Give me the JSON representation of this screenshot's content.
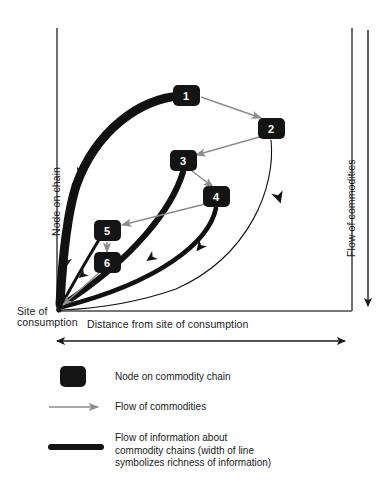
{
  "diagram": {
    "axes": {
      "y_label": "Node on chain",
      "x_label": "Distance from site of consumption",
      "right_label": "Flow of commodities",
      "origin_label_line1": "Site of",
      "origin_label_line2": "consumption"
    },
    "nodes": [
      {
        "id": "1",
        "label": "1",
        "x": 186,
        "y": 95
      },
      {
        "id": "2",
        "label": "2",
        "x": 271,
        "y": 128
      },
      {
        "id": "3",
        "label": "3",
        "x": 183,
        "y": 160
      },
      {
        "id": "4",
        "label": "4",
        "x": 216,
        "y": 196
      },
      {
        "id": "5",
        "label": "5",
        "x": 107,
        "y": 230
      },
      {
        "id": "6",
        "label": "6",
        "x": 107,
        "y": 262
      }
    ],
    "commodity_arrows": [
      {
        "from": "1",
        "to": "2"
      },
      {
        "from": "2",
        "to": "3"
      },
      {
        "from": "3",
        "to": "4"
      },
      {
        "from": "4",
        "to": "5"
      },
      {
        "from": "5",
        "to": "6"
      },
      {
        "from": "6",
        "to": "site-of-consumption"
      }
    ],
    "information_flows": [
      {
        "from": "1",
        "to": "site-of-consumption",
        "width": 9,
        "richness": "highest"
      },
      {
        "from": "3",
        "to": "site-of-consumption",
        "width": 6,
        "richness": "high"
      },
      {
        "from": "4",
        "to": "site-of-consumption",
        "width": 4.5,
        "richness": "medium"
      },
      {
        "from": "5",
        "to": "site-of-consumption",
        "width": 3,
        "richness": "low"
      },
      {
        "from": "2",
        "to": "site-of-consumption",
        "width": 1,
        "richness": "lowest"
      }
    ],
    "colors": {
      "ink": "#1a1a1a",
      "node_fill": "#141414",
      "node_text": "#ffffff",
      "commodity_arrow": "#8d8d8d",
      "information_line": "#111111",
      "axis": "#4a4a4a"
    }
  },
  "legend": {
    "items": [
      {
        "marker": "node-swatch",
        "text": "Node on commodity chain"
      },
      {
        "marker": "arrow-swatch",
        "text": "Flow of commodities"
      },
      {
        "marker": "thickline-swatch",
        "text": "Flow of information about\ncommodity chains (width of line\nsymbolizes richness of information)"
      }
    ]
  }
}
